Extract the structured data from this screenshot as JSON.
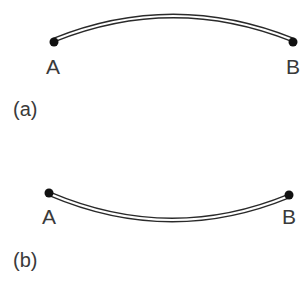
{
  "panels": [
    {
      "caption": "(a)",
      "start_label": "A",
      "end_label": "B",
      "curvature": "convex-up"
    },
    {
      "caption": "(b)",
      "start_label": "A",
      "end_label": "B",
      "curvature": "concave-up"
    }
  ],
  "colors": {
    "stroke": "#2a2a2a",
    "point": "#111111",
    "text": "#3a3a3a"
  }
}
